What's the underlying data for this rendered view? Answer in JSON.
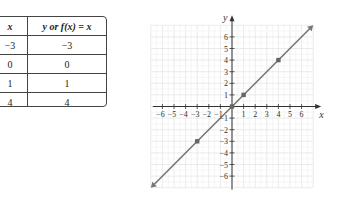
{
  "table": {
    "headers": [
      "x",
      "y or f(x) = x"
    ],
    "rows": [
      [
        "−3",
        "−3"
      ],
      [
        "0",
        "0"
      ],
      [
        "1",
        "1"
      ],
      [
        "4",
        "4"
      ]
    ]
  },
  "graph": {
    "x_axis_label": "x",
    "y_axis_label": "y",
    "x_ticks": [
      "−6",
      "−5",
      "−4",
      "−3",
      "−2",
      "−1",
      "1",
      "2",
      "3",
      "4",
      "5",
      "6"
    ],
    "y_ticks": [
      "6",
      "5",
      "4",
      "3",
      "2",
      "1",
      "−1",
      "−2",
      "−3",
      "−4",
      "−5",
      "−6"
    ]
  },
  "chart_data": {
    "type": "line",
    "title": "",
    "function": "f(x) = x",
    "xlabel": "x",
    "ylabel": "y",
    "xlim": [
      -7,
      7
    ],
    "ylim": [
      -7,
      7
    ],
    "grid": true,
    "series": [
      {
        "name": "y = x",
        "x": [
          -7,
          7
        ],
        "y": [
          -7,
          7
        ],
        "color": "#777777"
      }
    ],
    "points": [
      {
        "x": -3,
        "y": -3
      },
      {
        "x": 0,
        "y": 0
      },
      {
        "x": 1,
        "y": 1
      },
      {
        "x": 4,
        "y": 4
      }
    ],
    "table": {
      "columns": [
        "x",
        "y or f(x) = x"
      ],
      "rows": [
        [
          -3,
          -3
        ],
        [
          0,
          0
        ],
        [
          1,
          1
        ],
        [
          4,
          4
        ]
      ]
    }
  }
}
